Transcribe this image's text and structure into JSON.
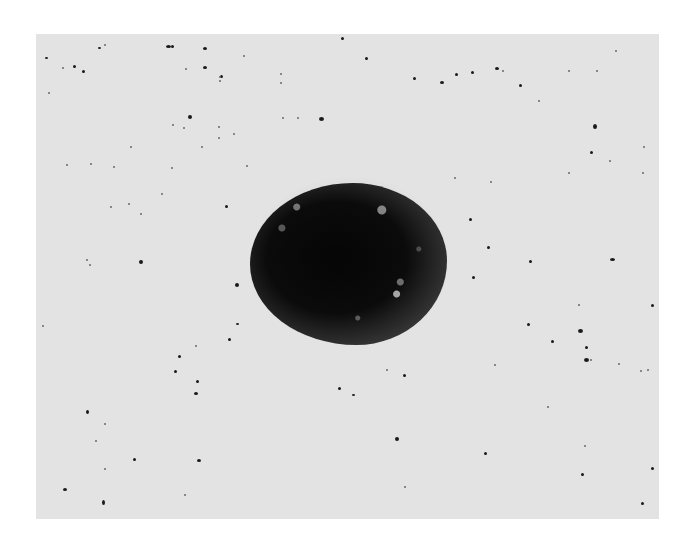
{
  "image": {
    "description": "Grayscale micrograph of a dark round particle with granular rim on a light speckled background",
    "background_color": "#ffffff",
    "field_color": "#e3e3e3",
    "specimen_color": "#0b0b0b"
  },
  "specks": [
    [
      45,
      57,
      3,
      2
    ],
    [
      62,
      67,
      2,
      2
    ],
    [
      73,
      65,
      3,
      3
    ],
    [
      98,
      47,
      3,
      2
    ],
    [
      104,
      44,
      2,
      2
    ],
    [
      166,
      45,
      5,
      3
    ],
    [
      171,
      45,
      3,
      3
    ],
    [
      185,
      68,
      2,
      2
    ],
    [
      203,
      47,
      4,
      3
    ],
    [
      203,
      66,
      4,
      3
    ],
    [
      220,
      75,
      3,
      3
    ],
    [
      219,
      80,
      2,
      2
    ],
    [
      219,
      76,
      2,
      2
    ],
    [
      243,
      55,
      2,
      2
    ],
    [
      188,
      115,
      4,
      4
    ],
    [
      172,
      124,
      2,
      2
    ],
    [
      183,
      127,
      2,
      2
    ],
    [
      218,
      126,
      2,
      2
    ],
    [
      218,
      137,
      2,
      2
    ],
    [
      233,
      133,
      2,
      2
    ],
    [
      280,
      73,
      2,
      2
    ],
    [
      280,
      82,
      2,
      2
    ],
    [
      282,
      117,
      2,
      2
    ],
    [
      297,
      117,
      2,
      2
    ],
    [
      319,
      117,
      5,
      4
    ],
    [
      246,
      165,
      2,
      2
    ],
    [
      171,
      167,
      2,
      2
    ],
    [
      90,
      163,
      2,
      2
    ],
    [
      66,
      164,
      2,
      2
    ],
    [
      48,
      92,
      2,
      2
    ],
    [
      82,
      70,
      3,
      3
    ],
    [
      113,
      166,
      2,
      2
    ],
    [
      130,
      146,
      2,
      2
    ],
    [
      201,
      146,
      2,
      2
    ],
    [
      341,
      37,
      3,
      3
    ],
    [
      365,
      57,
      3,
      3
    ],
    [
      413,
      77,
      3,
      3
    ],
    [
      440,
      81,
      4,
      3
    ],
    [
      455,
      73,
      3,
      3
    ],
    [
      471,
      71,
      3,
      3
    ],
    [
      495,
      67,
      4,
      3
    ],
    [
      502,
      70,
      2,
      2
    ],
    [
      519,
      84,
      3,
      3
    ],
    [
      538,
      100,
      2,
      2
    ],
    [
      568,
      70,
      2,
      2
    ],
    [
      596,
      70,
      2,
      2
    ],
    [
      615,
      50,
      2,
      2
    ],
    [
      593,
      124,
      4,
      5
    ],
    [
      590,
      151,
      3,
      3
    ],
    [
      609,
      160,
      2,
      2
    ],
    [
      643,
      146,
      2,
      2
    ],
    [
      454,
      177,
      2,
      2
    ],
    [
      490,
      181,
      2,
      2
    ],
    [
      568,
      172,
      2,
      2
    ],
    [
      642,
      172,
      2,
      2
    ],
    [
      128,
      203,
      2,
      2
    ],
    [
      140,
      213,
      2,
      2
    ],
    [
      110,
      206,
      2,
      2
    ],
    [
      161,
      193,
      2,
      2
    ],
    [
      225,
      205,
      3,
      3
    ],
    [
      139,
      260,
      4,
      4
    ],
    [
      86,
      259,
      2,
      2
    ],
    [
      235,
      283,
      4,
      4
    ],
    [
      236,
      323,
      3,
      2
    ],
    [
      228,
      338,
      3,
      3
    ],
    [
      195,
      345,
      2,
      2
    ],
    [
      178,
      355,
      3,
      3
    ],
    [
      89,
      264,
      2,
      2
    ],
    [
      42,
      325,
      2,
      2
    ],
    [
      469,
      218,
      3,
      3
    ],
    [
      487,
      246,
      3,
      3
    ],
    [
      529,
      260,
      3,
      3
    ],
    [
      610,
      258,
      5,
      3
    ],
    [
      472,
      276,
      3,
      3
    ],
    [
      578,
      304,
      2,
      2
    ],
    [
      651,
      304,
      3,
      3
    ],
    [
      527,
      323,
      3,
      3
    ],
    [
      578,
      329,
      5,
      4
    ],
    [
      551,
      340,
      3,
      3
    ],
    [
      585,
      346,
      3,
      3
    ],
    [
      584,
      358,
      5,
      4
    ],
    [
      618,
      363,
      2,
      2
    ],
    [
      494,
      364,
      2,
      2
    ],
    [
      196,
      380,
      3,
      3
    ],
    [
      174,
      370,
      3,
      3
    ],
    [
      86,
      410,
      3,
      4
    ],
    [
      194,
      392,
      4,
      3
    ],
    [
      104,
      423,
      2,
      2
    ],
    [
      95,
      440,
      2,
      2
    ],
    [
      133,
      458,
      3,
      3
    ],
    [
      104,
      468,
      2,
      2
    ],
    [
      197,
      459,
      4,
      3
    ],
    [
      63,
      488,
      4,
      3
    ],
    [
      102,
      500,
      3,
      5
    ],
    [
      184,
      494,
      2,
      2
    ],
    [
      338,
      387,
      3,
      3
    ],
    [
      386,
      369,
      2,
      2
    ],
    [
      403,
      374,
      3,
      3
    ],
    [
      590,
      359,
      2,
      2
    ],
    [
      640,
      370,
      2,
      2
    ],
    [
      647,
      369,
      2,
      2
    ],
    [
      352,
      394,
      3,
      2
    ],
    [
      395,
      437,
      4,
      4
    ],
    [
      484,
      452,
      3,
      3
    ],
    [
      584,
      445,
      2,
      2
    ],
    [
      547,
      406,
      2,
      2
    ],
    [
      581,
      473,
      3,
      3
    ],
    [
      651,
      467,
      3,
      3
    ],
    [
      641,
      502,
      3,
      3
    ],
    [
      404,
      486,
      2,
      2
    ]
  ]
}
